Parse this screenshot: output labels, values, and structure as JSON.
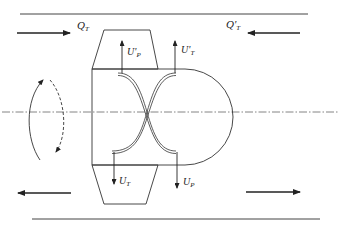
{
  "diagram": {
    "labels": {
      "q_t": {
        "main": "Q",
        "sub": "T"
      },
      "q_t_prime": {
        "main": "Q'",
        "sub": "T"
      },
      "u_p_prime": {
        "main": "U'",
        "sub": "P"
      },
      "u_t_prime": {
        "main": "U'",
        "sub": "T"
      },
      "u_t": {
        "main": "U",
        "sub": "T"
      },
      "u_p": {
        "main": "U",
        "sub": "P"
      }
    },
    "colors": {
      "stroke": "#333333",
      "centerline": "#555555"
    }
  }
}
